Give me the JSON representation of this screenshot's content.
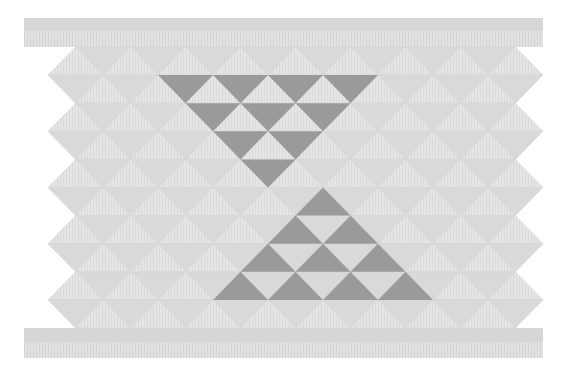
{
  "pattern": {
    "name": "taniko-triangle-band",
    "colors": {
      "background": "#ffffff",
      "band_solid": "#d6d6d6",
      "band_striped": "#e2e2e2",
      "stripe": "#d2d2d2",
      "light_up": "#e4e4e4",
      "light_down": "#d9d9d9",
      "dark": "#9a9a9a",
      "edge": "#cfcfcf"
    },
    "grid": {
      "top_y": 47,
      "row_height": 28.1,
      "rows": 10,
      "tri_width": 55,
      "even_offset": 20.5,
      "odd_offset": 48,
      "left_x": 21,
      "right_x": 543
    },
    "top_band": {
      "x": 24,
      "y": 18,
      "width": 519,
      "solid_height": 13,
      "striped_height": 16
    },
    "bottom_band": {
      "x": 24,
      "y": 328,
      "width": 519,
      "solid_height": 14,
      "striped_height": 16
    },
    "dark_down_triangles": [
      {
        "row": 1,
        "k": [
          2,
          3,
          4,
          5
        ]
      },
      {
        "row": 2,
        "k": [
          3,
          4,
          5
        ]
      },
      {
        "row": 3,
        "k": [
          3,
          4
        ]
      },
      {
        "row": 4,
        "k": [
          4
        ]
      }
    ],
    "dark_up_triangles": [
      {
        "row": 5,
        "k": [
          5
        ]
      },
      {
        "row": 6,
        "k": [
          5,
          6
        ]
      },
      {
        "row": 7,
        "k": [
          4,
          5,
          6
        ]
      },
      {
        "row": 8,
        "k": [
          4,
          5,
          6,
          7
        ]
      }
    ]
  }
}
